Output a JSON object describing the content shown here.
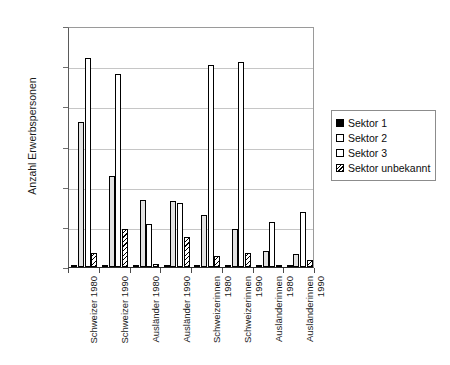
{
  "chart_data": {
    "type": "bar",
    "title": "",
    "xlabel": "",
    "ylabel": "Anzahl Erwerbspersonen",
    "ylim": [
      0,
      30000
    ],
    "ytick_labels": [
      "0",
      "5000",
      "10000",
      "15000",
      "20000",
      "25000",
      "30000"
    ],
    "ytick_values": [
      0,
      5000,
      10000,
      15000,
      20000,
      25000,
      30000
    ],
    "grid": true,
    "legend_position": "right",
    "categories": [
      "Schweizer 1980",
      "Schweizer 1990",
      "Ausländer 1980",
      "Ausländer 1990",
      "Schweizerinnen\n1980",
      "Schweizerinnen\n1990",
      "Ausländerinnen\n1980",
      "Ausländerinnen\n1990"
    ],
    "series": [
      {
        "name": "Sektor 1",
        "color": "#000000",
        "pattern": "solid",
        "values": [
          300,
          250,
          120,
          150,
          200,
          150,
          80,
          70
        ]
      },
      {
        "name": "Sektor 2",
        "color": "#e2e2e2",
        "pattern": "solid-light",
        "values": [
          18000,
          11300,
          8300,
          8200,
          6500,
          4700,
          2000,
          1600
        ]
      },
      {
        "name": "Sektor 3",
        "color": "#ffffff",
        "pattern": "empty",
        "values": [
          26000,
          24000,
          5300,
          8000,
          25200,
          25500,
          5600,
          6800
        ]
      },
      {
        "name": "Sektor unbekannt",
        "color": "#ffffff",
        "pattern": "diagonal-hatch",
        "values": [
          1700,
          4700,
          400,
          3700,
          1400,
          1700,
          250,
          900
        ]
      }
    ]
  },
  "legend": {
    "items": [
      {
        "label": "Sektor 1"
      },
      {
        "label": "Sektor 2"
      },
      {
        "label": "Sektor 3"
      },
      {
        "label": "Sektor unbekannt"
      }
    ]
  }
}
